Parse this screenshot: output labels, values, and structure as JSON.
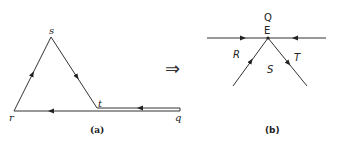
{
  "diagram_a": {
    "caption": "(a)",
    "vertices": {
      "s": {
        "label": "s"
      },
      "r": {
        "label": "r"
      },
      "t": {
        "label": "t"
      },
      "q": {
        "label": "q"
      }
    },
    "edges": [
      {
        "from": "r",
        "to": "s",
        "arrow": "forward"
      },
      {
        "from": "s",
        "to": "t",
        "arrow": "forward"
      },
      {
        "from": "q",
        "to": "t",
        "arrow": "forward"
      },
      {
        "from": "q",
        "to": "r",
        "arrow": "forward"
      }
    ]
  },
  "transform_arrow": "⇒",
  "diagram_b": {
    "caption": "(b)",
    "vertex": {
      "label": "E"
    },
    "regions": {
      "Q": "Q",
      "R": "R",
      "S": "S",
      "T": "T"
    },
    "edges": [
      {
        "name": "left-horizontal",
        "arrow": "toward E"
      },
      {
        "name": "right-horizontal",
        "arrow": "toward E"
      },
      {
        "name": "lower-left",
        "arrow": "toward E"
      },
      {
        "name": "lower-right",
        "arrow": "away from E"
      }
    ]
  },
  "colors": {
    "stroke": "#333333",
    "background": "#ffffff"
  }
}
